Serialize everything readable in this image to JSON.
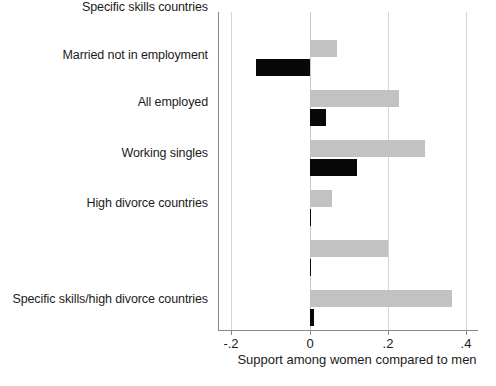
{
  "chart_data": {
    "type": "bar",
    "orientation": "horizontal",
    "title": "",
    "subtitle": "",
    "xlabel": "Support among women compared to men",
    "ylabel": "",
    "xlim": [
      -0.28,
      0.43
    ],
    "xticks": [
      -0.2,
      0,
      0.2,
      0.4
    ],
    "xticklabels": [
      "-.2",
      "0",
      ".2",
      ".4"
    ],
    "grid": "vertical",
    "legend": "none",
    "categories": [
      "Married not in employment",
      "All employed",
      "Working singles",
      "High divorce countries",
      "Specific skills countries",
      "Specific skills/high divorce countries"
    ],
    "series": [
      {
        "name": "gray",
        "color": "#c2c2c2",
        "values": [
          0.069,
          0.227,
          0.294,
          0.056,
          0.201,
          0.363
        ]
      },
      {
        "name": "black",
        "color": "#080808",
        "values": [
          -0.138,
          0.041,
          0.121,
          0.002,
          0.001,
          0.01
        ]
      }
    ]
  },
  "axis": {
    "x_title": "Support among women compared to men",
    "tick_labels": [
      "-.2",
      "0",
      ".2",
      ".4"
    ]
  },
  "categories": {
    "c0": "Married not in employment",
    "c1": "All employed",
    "c2": "Working singles",
    "c3": "High divorce countries",
    "c4": "Specific skills countries",
    "c5": "Specific skills/high divorce countries"
  }
}
